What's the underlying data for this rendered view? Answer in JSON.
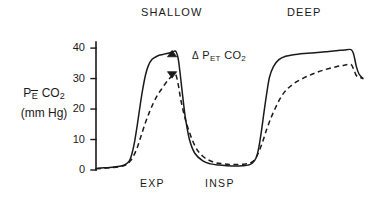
{
  "figure": {
    "top_labels": [
      {
        "name": "shallow",
        "text": "SHALLOW"
      },
      {
        "name": "deep",
        "text": "DEEP"
      }
    ],
    "bottom_labels": [
      {
        "name": "exp",
        "text": "EXP"
      },
      {
        "name": "insp",
        "text": "INSP"
      }
    ],
    "y_axis_label": {
      "line1_prefix": "P",
      "line1_sub": "E",
      "line1_suffix": " CO",
      "line1_sub2": "2",
      "line2": "(mm Hg)"
    },
    "annotation": {
      "delta": "Δ",
      "p": " P",
      "sub": "ET",
      "co": " CO",
      "sub2": "2"
    },
    "colors": {
      "ink": "#1a1a1a",
      "background": "#ffffff"
    }
  },
  "chart_data": {
    "type": "line",
    "title": "",
    "subtitle": "",
    "xlabel": "",
    "ylabel": "PĒ CO2 (mm Hg)",
    "ylim": [
      0,
      42
    ],
    "xlim": [
      0,
      100
    ],
    "grid": false,
    "legend": "none",
    "yticks": [
      0,
      10,
      20,
      30,
      40
    ],
    "ytick_labels": [
      "0",
      "10",
      "20",
      "30",
      "40"
    ],
    "xticks": [],
    "xtick_labels": [],
    "phase_annotations": [
      {
        "label": "SHALLOW",
        "x": 22
      },
      {
        "label": "DEEP",
        "x": 76
      },
      {
        "label": "EXP",
        "x": 20,
        "position": "below-axis"
      },
      {
        "label": "INSP",
        "x": 44,
        "position": "below-axis"
      }
    ],
    "markers": [
      {
        "name": "peak-marker-up",
        "shape": "triangle-up",
        "x": 28.5,
        "y": 38.2,
        "filled": true
      },
      {
        "name": "peak-marker-down",
        "shape": "triangle-down",
        "x": 28.5,
        "y": 31.2,
        "filled": true
      }
    ],
    "annotations": [
      {
        "text": "Δ PET CO2",
        "x": 33,
        "y": 35,
        "describes": "difference in end-tidal CO2 between solid and dashed traces"
      }
    ],
    "series": [
      {
        "name": "solid-trace",
        "style": "solid",
        "x": [
          0,
          3,
          6,
          9,
          11,
          12.5,
          13.5,
          14.5,
          15.5,
          16.5,
          17.5,
          18.5,
          19.5,
          21,
          23,
          25,
          27,
          28.5,
          29.3,
          30,
          30.8,
          31.6,
          32.5,
          33.5,
          35,
          37,
          40,
          43,
          46,
          49,
          52,
          55,
          57,
          58.5,
          60,
          61,
          62,
          63,
          64,
          65,
          66.5,
          68.5,
          71,
          74,
          78,
          82,
          86,
          90,
          93,
          95.5,
          96.5,
          97.5,
          98.5,
          100
        ],
        "y": [
          0.5,
          0.7,
          0.9,
          1.2,
          1.8,
          3.0,
          5.5,
          9.5,
          15.0,
          21.0,
          26.5,
          31.0,
          34.0,
          36.3,
          37.4,
          37.9,
          38.3,
          38.7,
          39.0,
          38.8,
          36.5,
          31.0,
          24.0,
          17.0,
          10.0,
          5.5,
          3.0,
          2.0,
          1.6,
          1.4,
          1.3,
          1.4,
          1.6,
          2.2,
          4.0,
          7.5,
          13.0,
          19.5,
          25.5,
          30.5,
          34.0,
          36.2,
          37.3,
          37.8,
          38.2,
          38.5,
          38.8,
          39.1,
          39.4,
          39.5,
          38.0,
          34.0,
          31.5,
          30.0
        ]
      },
      {
        "name": "dashed-trace",
        "style": "dashed",
        "x": [
          0,
          3,
          6,
          9,
          11,
          12.5,
          14,
          15.5,
          17,
          18.5,
          20,
          21.5,
          23,
          24.5,
          26,
          27.5,
          28.5,
          29.3,
          30,
          30.8,
          32,
          34,
          37,
          40,
          44,
          48,
          52,
          56,
          58,
          59.5,
          61,
          62.5,
          64,
          65.5,
          67,
          69,
          71,
          74,
          78,
          82,
          86,
          90,
          93,
          95.5,
          96.5,
          97.5,
          98.5,
          100
        ],
        "y": [
          0.4,
          0.6,
          0.8,
          1.1,
          1.6,
          2.6,
          4.5,
          7.5,
          11.5,
          15.5,
          19.0,
          22.0,
          24.5,
          26.5,
          28.4,
          30.0,
          30.9,
          31.2,
          31.0,
          28.0,
          22.0,
          15.0,
          8.0,
          4.5,
          2.6,
          2.0,
          1.8,
          2.0,
          2.4,
          3.5,
          6.0,
          9.5,
          13.5,
          17.0,
          20.0,
          23.5,
          26.0,
          28.3,
          30.3,
          31.8,
          33.0,
          33.9,
          34.4,
          34.6,
          33.0,
          31.0,
          30.5,
          30.0
        ]
      }
    ]
  }
}
